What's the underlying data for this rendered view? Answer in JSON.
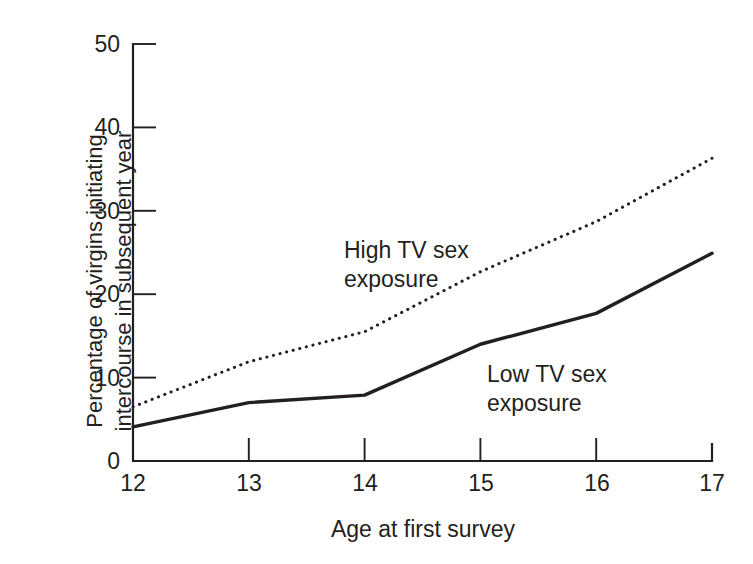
{
  "chart_data": {
    "type": "line",
    "title": "",
    "xlabel": "Age at first survey",
    "ylabel": "Percentage of virgins initiating intercourse in subsequent year",
    "ylabel_lines": [
      "Percentage of virgins initiating",
      "intercourse in subsequent year"
    ],
    "x": [
      12,
      13,
      14,
      15,
      16,
      17
    ],
    "xtick_labels": [
      "12",
      "13",
      "14",
      "15",
      "16",
      "17"
    ],
    "ytick_labels": [
      "0",
      "10",
      "20",
      "30",
      "40",
      "50"
    ],
    "yticks": [
      0,
      10,
      20,
      30,
      40,
      50
    ],
    "xlim": [
      12,
      17
    ],
    "ylim": [
      0,
      50
    ],
    "grid": false,
    "legend_position": "inline-annotations",
    "series": [
      {
        "name": "High TV sex exposure",
        "style": "dotted",
        "color": "#231f20",
        "label_lines": [
          "High TV sex",
          "exposure"
        ],
        "values": [
          6.5,
          11.9,
          15.5,
          22.7,
          28.7,
          36.3
        ]
      },
      {
        "name": "Low TV sex exposure",
        "style": "solid",
        "color": "#231f20",
        "label_lines": [
          "Low TV sex",
          "exposure"
        ],
        "values": [
          4.1,
          7.0,
          7.9,
          14.0,
          17.7,
          24.9
        ]
      }
    ],
    "annotations": [
      {
        "text": "High TV sex exposure",
        "x": 13.5,
        "y": 27
      },
      {
        "text": "Low TV sex exposure",
        "x": 15.0,
        "y": 12
      }
    ]
  },
  "axis": {
    "y_title_line1": "Percentage of virgins initiating",
    "y_title_line2": "intercourse in subsequent year",
    "x_title": "Age at first survey"
  },
  "labels": {
    "high_line1": "High TV sex",
    "high_line2": "exposure",
    "low_line1": "Low TV sex",
    "low_line2": "exposure"
  },
  "colors": {
    "ink": "#231f20",
    "background": "#ffffff"
  }
}
